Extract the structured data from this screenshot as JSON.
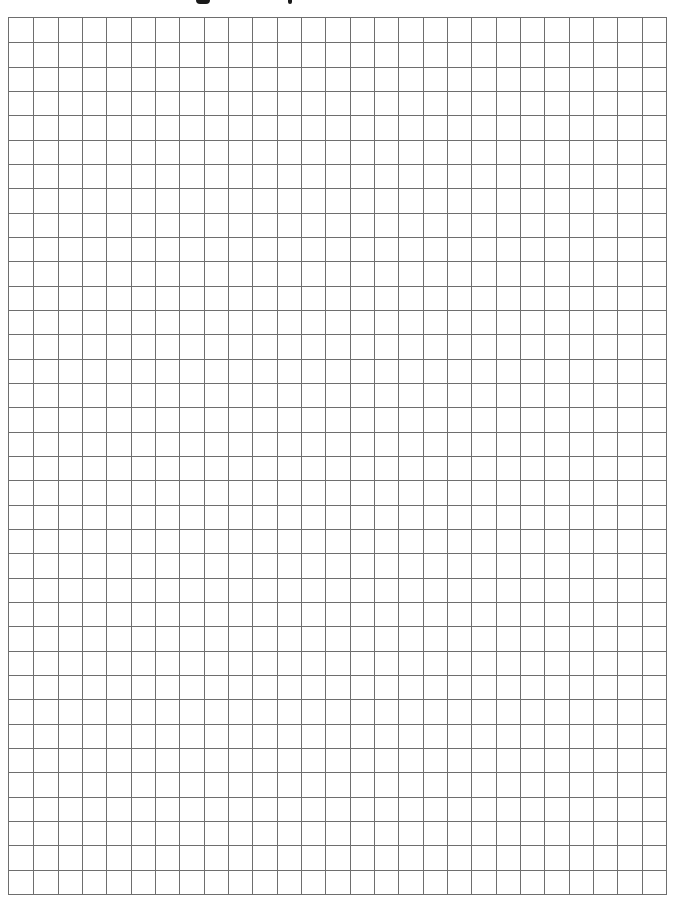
{
  "page": {
    "type": "graph-paper",
    "background": "#ffffff"
  },
  "title_remnant": {
    "visible_text": "",
    "descenders": [
      {
        "left": 196,
        "width": 14,
        "height": 4
      },
      {
        "left": 288,
        "width": 4,
        "height": 4
      }
    ]
  },
  "grid": {
    "left": 8,
    "top": 17,
    "width": 659,
    "height": 878,
    "columns": 27,
    "rows": 36,
    "line_color": "#6e6e6e",
    "line_width": 1
  }
}
